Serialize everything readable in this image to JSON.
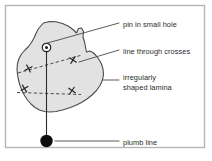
{
  "figure": {
    "background_color": "#ffffff",
    "border_color": "#b6b6b6",
    "ink_color": "#2b2b2b",
    "lamina_fill": "#e2e2e2",
    "lamina_stroke": "#4a4a4a"
  },
  "labels": {
    "pin": "pin in small hole",
    "line_through_crosses": "line through crosses",
    "lamina_line1": "irregularly",
    "lamina_line2": "shaped lamina",
    "plumb": "plumb line"
  },
  "elements": {
    "pin_name": "pin in small hole",
    "plumb_bob_name": "plumb bob",
    "lamina_name": "irregularly shaped lamina",
    "crosses_count": 4,
    "plumb_line_name": "plumb line",
    "dashed_line_name": "line through crosses"
  },
  "geometry": {
    "border": {
      "x": 5,
      "y": 5,
      "width": 200,
      "height": 143
    },
    "pin": {
      "cx": 46.5,
      "cy": 47.5,
      "r_outer": 4.2,
      "r_inner": 1.5
    },
    "plumb_bob": {
      "cx": 46.5,
      "cy": 141,
      "r": 6.2
    },
    "plumb_line": {
      "x1": 46.5,
      "y1": 47.5,
      "x2": 46.5,
      "y2": 134.8
    },
    "crosses": [
      {
        "cx": 28.5,
        "cy": 68.5,
        "size": 5.6,
        "rot": 18
      },
      {
        "cx": 73.0,
        "cy": 60.0,
        "size": 5.6,
        "rot": -12
      },
      {
        "cx": 24.5,
        "cy": 88.5,
        "size": 5.6,
        "rot": 14
      },
      {
        "cx": 72.0,
        "cy": 90.5,
        "size": 5.6,
        "rot": -10
      }
    ],
    "dashed_lines": [
      {
        "x1": 18.0,
        "y1": 73.0,
        "x2": 82.0,
        "y2": 55.0
      },
      {
        "x1": 17.0,
        "y1": 92.5,
        "x2": 81.0,
        "y2": 94.5
      }
    ],
    "leaders": [
      {
        "name": "pin-leader",
        "x1": 44.0,
        "y1": 44.0,
        "x2": 119.0,
        "y2": 23.0
      },
      {
        "name": "crosses-leader",
        "x1": 79.0,
        "y1": 62.0,
        "x2": 119.0,
        "y2": 50.0
      },
      {
        "name": "lamina-leader",
        "x1": 103.0,
        "y1": 80.0,
        "x2": 119.0,
        "y2": 80.0
      },
      {
        "name": "plumb-leader",
        "x1": 55.0,
        "y1": 141.0,
        "x2": 119.0,
        "y2": 141.0
      }
    ],
    "label_anchors": {
      "pin": {
        "x": 123,
        "y": 25.5
      },
      "crosses": {
        "x": 123,
        "y": 52.5
      },
      "lamina1": {
        "x": 123,
        "y": 78.0
      },
      "lamina2": {
        "x": 123,
        "y": 88.5
      },
      "plumb": {
        "x": 123,
        "y": 143.5
      }
    },
    "lamina_path": "M 43.5 23.0 L 49.5 21.5 L 56.0 21.8 L 62.5 23.5 L 68.5 26.2 L 73.0 29.5 L 76.5 33.0 L 78.5 28.5 L 81.5 28.0 L 83.5 31.5 L 83.0 37.0 L 84.5 42.0 L 85.5 47.0 L 86.5 52.0 L 89.5 51.0 L 93.0 52.5 L 96.0 55.5 L 99.0 59.5 L 101.5 64.0 L 103.0 69.0 L 103.5 74.5 L 102.5 80.0 L 100.0 85.5 L 96.5 90.5 L 92.0 95.0 L 87.0 99.0 L 81.5 102.5 L 75.5 105.5 L 69.0 108.0 L 62.5 110.0 L 56.0 111.5 L 50.0 112.0 L 44.5 111.5 L 39.5 110.0 L 35.0 107.5 L 31.0 104.0 L 27.5 100.0 L 24.5 95.5 L 22.0 90.5 L 20.0 85.5 L 18.5 80.0 L 17.5 74.5 L 17.0 69.0 L 17.5 63.5 L 19.0 58.5 L 21.5 54.0 L 25.0 50.0 L 28.5 46.5 L 31.5 42.5 L 34.0 38.0 L 36.0 33.5 L 38.5 28.5 Z"
  }
}
